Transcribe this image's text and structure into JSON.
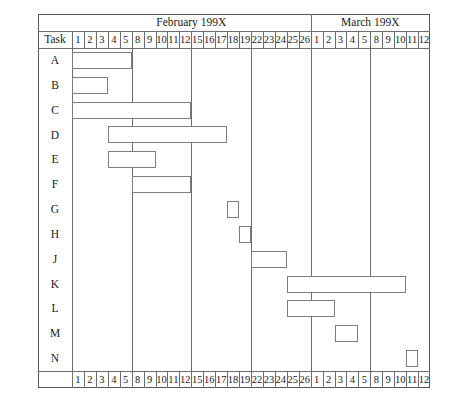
{
  "chart_data": {
    "type": "bar",
    "chart_kind": "gantt",
    "title": "",
    "xlabel": "",
    "ylabel": "Task",
    "task_column_header": "Task",
    "months": [
      {
        "label": "February 199X",
        "days": [
          "1",
          "2",
          "3",
          "4",
          "5",
          "8",
          "9",
          "10",
          "11",
          "12",
          "15",
          "16",
          "17",
          "18",
          "19",
          "22",
          "23",
          "24",
          "25",
          "26"
        ]
      },
      {
        "label": "March 199X",
        "days": [
          "1",
          "2",
          "3",
          "4",
          "5",
          "8",
          "9",
          "10",
          "11",
          "12"
        ]
      }
    ],
    "day_columns": [
      "1",
      "2",
      "3",
      "4",
      "5",
      "8",
      "9",
      "10",
      "11",
      "12",
      "15",
      "16",
      "17",
      "18",
      "19",
      "22",
      "23",
      "24",
      "25",
      "26",
      "1",
      "2",
      "3",
      "4",
      "5",
      "8",
      "9",
      "10",
      "11",
      "12"
    ],
    "week_breaks": [
      5,
      10,
      15,
      20,
      25
    ],
    "tasks": [
      "A",
      "B",
      "C",
      "D",
      "E",
      "F",
      "G",
      "H",
      "J",
      "K",
      "L",
      "M",
      "N"
    ],
    "bars": [
      {
        "task": "A",
        "start_index": 0,
        "end_index": 4,
        "start_label": "Feb 1",
        "end_label": "Feb 5"
      },
      {
        "task": "B",
        "start_index": 0,
        "end_index": 2,
        "start_label": "Feb 1",
        "end_label": "Feb 3"
      },
      {
        "task": "C",
        "start_index": 0,
        "end_index": 9,
        "start_label": "Feb 1",
        "end_label": "Feb 12"
      },
      {
        "task": "D",
        "start_index": 3,
        "end_index": 12,
        "start_label": "Feb 4",
        "end_label": "Feb 17"
      },
      {
        "task": "E",
        "start_index": 3,
        "end_index": 6,
        "start_label": "Feb 4",
        "end_label": "Feb 9"
      },
      {
        "task": "F",
        "start_index": 5,
        "end_index": 9,
        "start_label": "Feb 8",
        "end_label": "Feb 12"
      },
      {
        "task": "G",
        "start_index": 13,
        "end_index": 13,
        "start_label": "Feb 18",
        "end_label": "Feb 18"
      },
      {
        "task": "H",
        "start_index": 14,
        "end_index": 14,
        "start_label": "Feb 19",
        "end_label": "Feb 19"
      },
      {
        "task": "J",
        "start_index": 15,
        "end_index": 17,
        "start_label": "Feb 22",
        "end_label": "Feb 24"
      },
      {
        "task": "K",
        "start_index": 18,
        "end_index": 27,
        "start_label": "Feb 25",
        "end_label": "Mar 10"
      },
      {
        "task": "L",
        "start_index": 18,
        "end_index": 21,
        "start_label": "Feb 25",
        "end_label": "Mar 2"
      },
      {
        "task": "M",
        "start_index": 22,
        "end_index": 23,
        "start_label": "Mar 3",
        "end_label": "Mar 4"
      },
      {
        "task": "N",
        "start_index": 28,
        "end_index": 28,
        "start_label": "Mar 11",
        "end_label": "Mar 11"
      }
    ],
    "colors": {
      "bar_fill": "#ffffff",
      "bar_stroke": "#7a7d81",
      "grid": "#6a6d71",
      "frame": "#55585c",
      "text": "#1a1a1a",
      "background": "#ffffff"
    },
    "grid": true,
    "legend": "none"
  }
}
